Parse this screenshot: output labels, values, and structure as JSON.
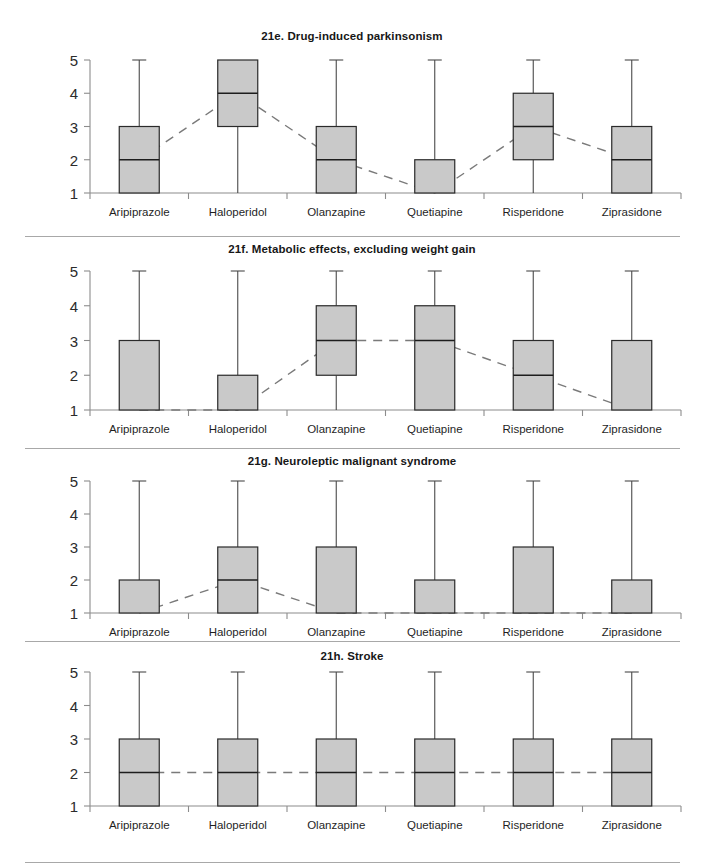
{
  "figure": {
    "categories": [
      "Aripiprazole",
      "Haloperidol",
      "Olanzapine",
      "Quetiapine",
      "Risperidone",
      "Ziprasidone"
    ],
    "y_ticks": [
      "1",
      "2",
      "3",
      "4",
      "5"
    ],
    "colors": {
      "box_fill": "#c9c9c9",
      "box_stroke": "#2a2a2a",
      "axis": "#8c8c8c",
      "trend": "#7a7a7a",
      "text": "#1a1a1a"
    }
  },
  "chart_data": [
    {
      "type": "box",
      "title": "21e. Drug-induced parkinsonism",
      "xlabel": "",
      "ylabel": "",
      "ylim": [
        1,
        5
      ],
      "yticks": [
        1,
        2,
        3,
        4,
        5
      ],
      "grid": false,
      "legend": "none",
      "categories": [
        "Aripiprazole",
        "Haloperidol",
        "Olanzapine",
        "Quetiapine",
        "Risperidone",
        "Ziprasidone"
      ],
      "boxes": [
        {
          "category": "Aripiprazole",
          "whisker_low": 1,
          "q1": 1,
          "median": 2,
          "q3": 3,
          "whisker_high": 5
        },
        {
          "category": "Haloperidol",
          "whisker_low": 1,
          "q1": 3,
          "median": 4,
          "q3": 5,
          "whisker_high": 5
        },
        {
          "category": "Olanzapine",
          "whisker_low": 1,
          "q1": 1,
          "median": 2,
          "q3": 3,
          "whisker_high": 5
        },
        {
          "category": "Quetiapine",
          "whisker_low": 1,
          "q1": 1,
          "median": 1,
          "q3": 2,
          "whisker_high": 5
        },
        {
          "category": "Risperidone",
          "whisker_low": 1,
          "q1": 2,
          "median": 3,
          "q3": 4,
          "whisker_high": 5
        },
        {
          "category": "Ziprasidone",
          "whisker_low": 1,
          "q1": 1,
          "median": 2,
          "q3": 3,
          "whisker_high": 5
        }
      ],
      "median_trend": [
        2,
        4,
        2,
        1,
        3,
        2
      ]
    },
    {
      "type": "box",
      "title": "21f. Metabolic effects, excluding weight gain",
      "xlabel": "",
      "ylabel": "",
      "ylim": [
        1,
        5
      ],
      "yticks": [
        1,
        2,
        3,
        4,
        5
      ],
      "grid": false,
      "legend": "none",
      "categories": [
        "Aripiprazole",
        "Haloperidol",
        "Olanzapine",
        "Quetiapine",
        "Risperidone",
        "Ziprasidone"
      ],
      "boxes": [
        {
          "category": "Aripiprazole",
          "whisker_low": 1,
          "q1": 1,
          "median": 1,
          "q3": 3,
          "whisker_high": 5
        },
        {
          "category": "Haloperidol",
          "whisker_low": 1,
          "q1": 1,
          "median": 1,
          "q3": 2,
          "whisker_high": 5
        },
        {
          "category": "Olanzapine",
          "whisker_low": 1,
          "q1": 2,
          "median": 3,
          "q3": 4,
          "whisker_high": 5
        },
        {
          "category": "Quetiapine",
          "whisker_low": 1,
          "q1": 1,
          "median": 3,
          "q3": 4,
          "whisker_high": 5
        },
        {
          "category": "Risperidone",
          "whisker_low": 1,
          "q1": 1,
          "median": 2,
          "q3": 3,
          "whisker_high": 5
        },
        {
          "category": "Ziprasidone",
          "whisker_low": 1,
          "q1": 1,
          "median": 1,
          "q3": 3,
          "whisker_high": 5
        }
      ],
      "median_trend": [
        1,
        1,
        3,
        3,
        2,
        1
      ]
    },
    {
      "type": "box",
      "title": "21g. Neuroleptic malignant syndrome",
      "xlabel": "",
      "ylabel": "",
      "ylim": [
        1,
        5
      ],
      "yticks": [
        1,
        2,
        3,
        4,
        5
      ],
      "grid": false,
      "legend": "none",
      "categories": [
        "Aripiprazole",
        "Haloperidol",
        "Olanzapine",
        "Quetiapine",
        "Risperidone",
        "Ziprasidone"
      ],
      "boxes": [
        {
          "category": "Aripiprazole",
          "whisker_low": 1,
          "q1": 1,
          "median": 1,
          "q3": 2,
          "whisker_high": 5
        },
        {
          "category": "Haloperidol",
          "whisker_low": 1,
          "q1": 1,
          "median": 2,
          "q3": 3,
          "whisker_high": 5
        },
        {
          "category": "Olanzapine",
          "whisker_low": 1,
          "q1": 1,
          "median": 1,
          "q3": 3,
          "whisker_high": 5
        },
        {
          "category": "Quetiapine",
          "whisker_low": 1,
          "q1": 1,
          "median": 1,
          "q3": 2,
          "whisker_high": 5
        },
        {
          "category": "Risperidone",
          "whisker_low": 1,
          "q1": 1,
          "median": 1,
          "q3": 3,
          "whisker_high": 5
        },
        {
          "category": "Ziprasidone",
          "whisker_low": 1,
          "q1": 1,
          "median": 1,
          "q3": 2,
          "whisker_high": 5
        }
      ],
      "median_trend": [
        1,
        2,
        1,
        1,
        1,
        1
      ]
    },
    {
      "type": "box",
      "title": "21h. Stroke",
      "xlabel": "",
      "ylabel": "",
      "ylim": [
        1,
        5
      ],
      "yticks": [
        1,
        2,
        3,
        4,
        5
      ],
      "grid": false,
      "legend": "none",
      "categories": [
        "Aripiprazole",
        "Haloperidol",
        "Olanzapine",
        "Quetiapine",
        "Risperidone",
        "Ziprasidone"
      ],
      "boxes": [
        {
          "category": "Aripiprazole",
          "whisker_low": 1,
          "q1": 1,
          "median": 2,
          "q3": 3,
          "whisker_high": 5
        },
        {
          "category": "Haloperidol",
          "whisker_low": 1,
          "q1": 1,
          "median": 2,
          "q3": 3,
          "whisker_high": 5
        },
        {
          "category": "Olanzapine",
          "whisker_low": 1,
          "q1": 1,
          "median": 2,
          "q3": 3,
          "whisker_high": 5
        },
        {
          "category": "Quetiapine",
          "whisker_low": 1,
          "q1": 1,
          "median": 2,
          "q3": 3,
          "whisker_high": 5
        },
        {
          "category": "Risperidone",
          "whisker_low": 1,
          "q1": 1,
          "median": 2,
          "q3": 3,
          "whisker_high": 5
        },
        {
          "category": "Ziprasidone",
          "whisker_low": 1,
          "q1": 1,
          "median": 2,
          "q3": 3,
          "whisker_high": 5
        }
      ],
      "median_trend": [
        2,
        2,
        2,
        2,
        2,
        2
      ]
    }
  ]
}
